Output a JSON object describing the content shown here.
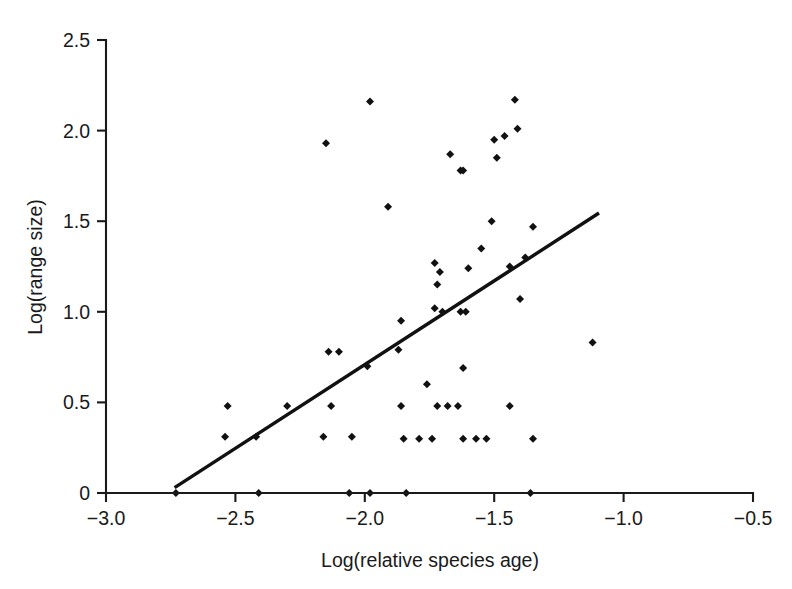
{
  "chart_data": {
    "type": "scatter",
    "title": "",
    "xlabel": "Log(relative species age)",
    "ylabel": "Log(range size)",
    "xlim": [
      -3.0,
      -0.5
    ],
    "ylim": [
      0,
      2.5
    ],
    "xticks": [
      -3.0,
      -2.5,
      -2.0,
      -1.5,
      -1.0,
      -0.5
    ],
    "xticklabels": [
      "−3.0",
      "−2.5",
      "−2.0",
      "−1.5",
      "−1.0",
      "−0.5"
    ],
    "yticks": [
      0,
      0.5,
      1.0,
      1.5,
      2.0,
      2.5
    ],
    "yticklabels": [
      "0",
      "0.5",
      "1.0",
      "1.5",
      "2.0",
      "2.5"
    ],
    "grid": false,
    "legend": null,
    "marker": "diamond",
    "marker_color": "#111111",
    "series": [
      {
        "name": "species",
        "points": [
          [
            -2.73,
            0.0
          ],
          [
            -2.41,
            0.0
          ],
          [
            -2.06,
            0.0
          ],
          [
            -1.98,
            0.0
          ],
          [
            -1.84,
            0.0
          ],
          [
            -1.36,
            0.0
          ],
          [
            -2.53,
            0.48
          ],
          [
            -2.3,
            0.48
          ],
          [
            -2.13,
            0.48
          ],
          [
            -1.86,
            0.48
          ],
          [
            -1.72,
            0.48
          ],
          [
            -1.68,
            0.48
          ],
          [
            -1.64,
            0.48
          ],
          [
            -1.44,
            0.48
          ],
          [
            -2.54,
            0.31
          ],
          [
            -2.42,
            0.31
          ],
          [
            -2.16,
            0.31
          ],
          [
            -2.05,
            0.31
          ],
          [
            -1.85,
            0.3
          ],
          [
            -1.79,
            0.3
          ],
          [
            -1.74,
            0.3
          ],
          [
            -1.62,
            0.3
          ],
          [
            -1.57,
            0.3
          ],
          [
            -1.53,
            0.3
          ],
          [
            -1.35,
            0.3
          ],
          [
            -2.14,
            0.78
          ],
          [
            -2.1,
            0.78
          ],
          [
            -1.87,
            0.79
          ],
          [
            -1.99,
            0.7
          ],
          [
            -1.76,
            0.6
          ],
          [
            -1.62,
            0.69
          ],
          [
            -1.86,
            0.95
          ],
          [
            -1.73,
            1.02
          ],
          [
            -1.7,
            1.0
          ],
          [
            -1.63,
            1.0
          ],
          [
            -1.61,
            1.0
          ],
          [
            -1.4,
            1.07
          ],
          [
            -1.72,
            1.15
          ],
          [
            -1.71,
            1.22
          ],
          [
            -1.73,
            1.27
          ],
          [
            -1.6,
            1.24
          ],
          [
            -1.44,
            1.25
          ],
          [
            -1.38,
            1.3
          ],
          [
            -1.55,
            1.35
          ],
          [
            -1.51,
            1.5
          ],
          [
            -1.35,
            1.47
          ],
          [
            -1.91,
            1.58
          ],
          [
            -1.63,
            1.78
          ],
          [
            -1.62,
            1.78
          ],
          [
            -1.67,
            1.87
          ],
          [
            -1.49,
            1.85
          ],
          [
            -1.5,
            1.95
          ],
          [
            -1.46,
            1.97
          ],
          [
            -1.41,
            2.01
          ],
          [
            -1.42,
            2.17
          ],
          [
            -2.15,
            1.93
          ],
          [
            -1.98,
            2.16
          ],
          [
            -1.12,
            0.83
          ]
        ]
      }
    ],
    "fit_line": {
      "name": "regression-line",
      "x_start": -2.735,
      "y_start": 0.03,
      "x_end": -1.095,
      "y_end": 1.545,
      "color": "#111111"
    }
  }
}
